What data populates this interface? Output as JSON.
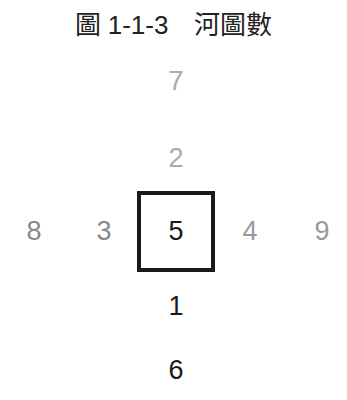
{
  "title": "圖 1-1-3　河圖數",
  "diagram": {
    "type": "river-chart-hetu",
    "center": {
      "value": "5",
      "color": "#1a1a1a",
      "boxed": true
    },
    "numbers": [
      {
        "id": "top-outer",
        "value": "7",
        "color": "#aaaaaa"
      },
      {
        "id": "top-inner",
        "value": "2",
        "color": "#aaaaaa"
      },
      {
        "id": "left-outer",
        "value": "8",
        "color": "#888888"
      },
      {
        "id": "left-inner",
        "value": "3",
        "color": "#888888"
      },
      {
        "id": "right-inner",
        "value": "4",
        "color": "#999999"
      },
      {
        "id": "right-outer",
        "value": "9",
        "color": "#999999"
      },
      {
        "id": "bottom-inner",
        "value": "1",
        "color": "#1a1a1a"
      },
      {
        "id": "bottom-outer",
        "value": "6",
        "color": "#1a1a1a"
      }
    ]
  }
}
